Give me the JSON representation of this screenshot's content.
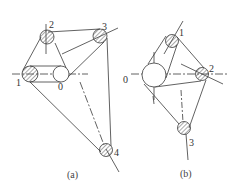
{
  "figure": {
    "subfigures": [
      {
        "id": "a",
        "label": "(a)",
        "pulleys": [
          {
            "name": "0",
            "label": "0",
            "type": "plain"
          },
          {
            "name": "1",
            "label": "1",
            "type": "hatched"
          },
          {
            "name": "2",
            "label": "2",
            "type": "hatched"
          },
          {
            "name": "3",
            "label": "3",
            "type": "hatched"
          },
          {
            "name": "4",
            "label": "4",
            "type": "hatched"
          }
        ]
      },
      {
        "id": "b",
        "label": "(b)",
        "pulleys": [
          {
            "name": "0",
            "label": "0",
            "type": "plain-large"
          },
          {
            "name": "1",
            "label": "1",
            "type": "hatched"
          },
          {
            "name": "2",
            "label": "2",
            "type": "hatched"
          },
          {
            "name": "3",
            "label": "3",
            "type": "hatched"
          }
        ]
      }
    ],
    "colors": {
      "line": "#3a3a3a",
      "hatch": "#555555",
      "background": "#ffffff"
    }
  }
}
